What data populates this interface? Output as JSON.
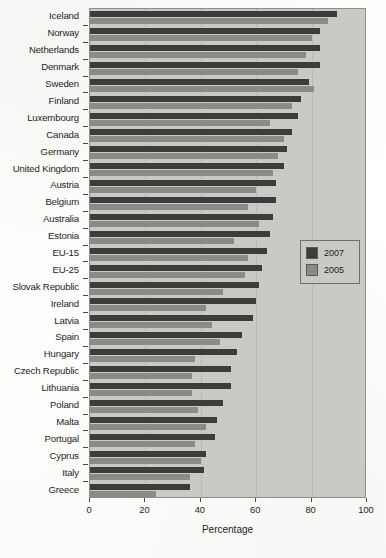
{
  "chart_data": {
    "type": "bar",
    "orientation": "horizontal",
    "title": "",
    "subtitle": "",
    "xlabel": "Percentage",
    "ylabel": "",
    "xlim": [
      0,
      100
    ],
    "xticks": [
      0,
      20,
      40,
      60,
      80,
      100
    ],
    "xtick_labels": [
      "0",
      "20",
      "40",
      "60",
      "80",
      "100"
    ],
    "grid": true,
    "grid_axis": "x",
    "legend_position": "center-right",
    "categories": [
      "Iceland",
      "Norway",
      "Netherlands",
      "Denmark",
      "Sweden",
      "Finland",
      "Luxembourg",
      "Canada",
      "Germany",
      "United Kingdom",
      "Austria",
      "Belgium",
      "Australia",
      "Estonia",
      "EU-15",
      "EU-25",
      "Slovak Republic",
      "Ireland",
      "Latvia",
      "Spain",
      "Hungary",
      "Czech Republic",
      "Lithuania",
      "Poland",
      "Malta",
      "Portugal",
      "Cyprus",
      "Italy",
      "Greece"
    ],
    "series": [
      {
        "name": "2007",
        "color": "#3c3c3c",
        "values": [
          89,
          83,
          83,
          83,
          79,
          76,
          75,
          73,
          71,
          70,
          67,
          67,
          66,
          65,
          64,
          62,
          61,
          60,
          59,
          55,
          53,
          51,
          51,
          48,
          46,
          45,
          42,
          41,
          36
        ]
      },
      {
        "name": "2005",
        "color": "#8a8a87",
        "values": [
          86,
          80,
          78,
          75,
          81,
          73,
          65,
          70,
          68,
          66,
          60,
          57,
          61,
          52,
          57,
          56,
          48,
          42,
          44,
          47,
          38,
          37,
          37,
          39,
          42,
          38,
          40,
          36,
          24
        ]
      }
    ],
    "legend": [
      {
        "label": "2007",
        "color": "#3c3c3c"
      },
      {
        "label": "2005",
        "color": "#8a8a87"
      }
    ]
  }
}
